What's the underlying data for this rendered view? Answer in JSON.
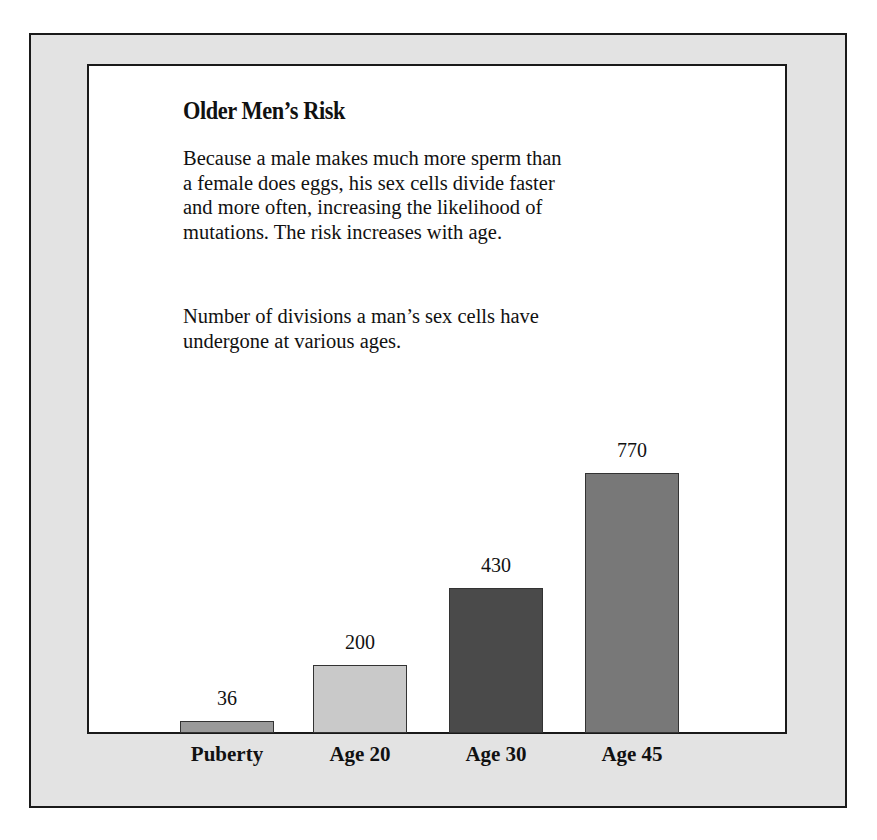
{
  "figure": {
    "title": "Older Men’s Risk",
    "description": "Because a male makes much more sperm than a female does eggs, his sex cells divide faster and more often, increasing the likelihood of mutations. The risk increases with age.",
    "description_lines": [
      "Because a male makes much more sperm than",
      "a female does eggs, his sex cells divide faster",
      "and more often, increasing the likelihood of",
      "mutations. The risk increases with age."
    ],
    "chart_caption_lines": [
      "Number of divisions a man’s sex cells have",
      "undergone at various ages."
    ]
  },
  "chart_data": {
    "type": "bar",
    "title": "Older Men’s Risk",
    "subtitle": "Number of divisions a man’s sex cells have undergone at various ages.",
    "categories": [
      "Puberty",
      "Age 20",
      "Age 30",
      "Age 45"
    ],
    "values": [
      36,
      200,
      430,
      770
    ],
    "value_labels": [
      "36",
      "200",
      "430",
      "770"
    ],
    "colors": [
      "#9a9a9a",
      "#c9c9c9",
      "#4a4a4a",
      "#787878"
    ],
    "xlabel": "",
    "ylabel": "Number of divisions",
    "ylim": [
      0,
      800
    ],
    "grid": false,
    "legend": "none",
    "data_labels": "above bars"
  }
}
